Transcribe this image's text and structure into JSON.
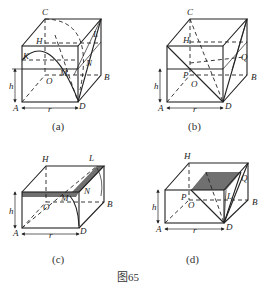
{
  "figure": {
    "caption": "图65",
    "panels": [
      {
        "id": "a",
        "caption": "(a)",
        "labels": {
          "C": "C",
          "H": "H",
          "L": "L",
          "K": "K",
          "M": "M",
          "N": "N",
          "O": "O",
          "B": "B",
          "A": "A",
          "D": "D",
          "h": "h",
          "r": "r"
        }
      },
      {
        "id": "b",
        "caption": "(b)",
        "labels": {
          "C": "C",
          "H": "H",
          "Q": "Q",
          "P": "P",
          "O": "O",
          "B": "B",
          "A": "A",
          "D": "D",
          "h": "h",
          "r": "r"
        }
      },
      {
        "id": "c",
        "caption": "(c)",
        "labels": {
          "H": "H",
          "L": "L",
          "M": "M",
          "N": "N",
          "O": "O",
          "B": "B",
          "A": "A",
          "D": "D",
          "h": "h",
          "r": "r"
        }
      },
      {
        "id": "d",
        "caption": "(d)",
        "labels": {
          "H": "H",
          "Q": "Q",
          "P": "P",
          "O": "O",
          "L": "L",
          "B": "B",
          "A": "A",
          "D": "D",
          "h": "h",
          "r": "r"
        }
      }
    ],
    "colors": {
      "line": "#222222",
      "shade": "#707070",
      "background": "#ffffff"
    }
  }
}
